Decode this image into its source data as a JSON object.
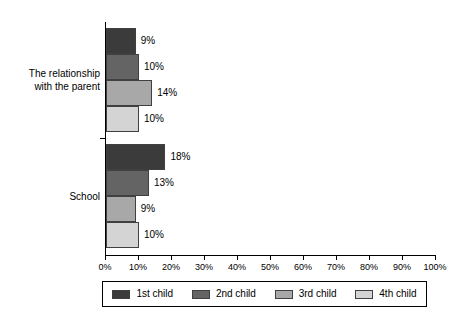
{
  "chart_data": {
    "type": "bar",
    "orientation": "horizontal",
    "title": "",
    "subtitle": "",
    "xlabel": "",
    "ylabel": "",
    "grid": false,
    "legend_position": "bottom",
    "xlim": [
      0,
      100
    ],
    "x_tick_labels": [
      "0%",
      "10%",
      "20%",
      "30%",
      "40%",
      "50%",
      "60%",
      "70%",
      "80%",
      "90%",
      "100%"
    ],
    "x_tick_values": [
      0,
      10,
      20,
      30,
      40,
      50,
      60,
      70,
      80,
      90,
      100
    ],
    "categories": [
      "The relationship with the parent",
      "School"
    ],
    "category_label_lines": [
      [
        "The relationship",
        "with the parent"
      ],
      [
        "School"
      ]
    ],
    "series": [
      {
        "name": "1st child",
        "color": "#3b3b3b",
        "values": [
          9,
          18
        ],
        "data_labels": [
          "9%",
          "18%"
        ]
      },
      {
        "name": "2nd child",
        "color": "#646464",
        "values": [
          10,
          13
        ],
        "data_labels": [
          "10%",
          "13%"
        ]
      },
      {
        "name": "3rd child",
        "color": "#a8a8a8",
        "values": [
          14,
          9
        ],
        "data_labels": [
          "14%",
          "9%"
        ]
      },
      {
        "name": "4th child",
        "color": "#d4d4d4",
        "values": [
          10,
          10
        ],
        "data_labels": [
          "10%",
          "10%"
        ]
      }
    ]
  },
  "legend": {
    "items": [
      {
        "label": "1st child",
        "color": "#3b3b3b"
      },
      {
        "label": "2nd child",
        "color": "#646464"
      },
      {
        "label": "3rd child",
        "color": "#a8a8a8"
      },
      {
        "label": "4th child",
        "color": "#d4d4d4"
      }
    ]
  },
  "axis": {
    "line_color": "#000000"
  }
}
